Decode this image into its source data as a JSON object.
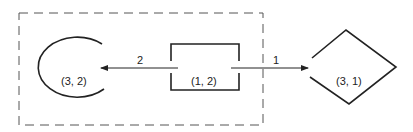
{
  "diagram": {
    "colors": {
      "stroke": "#222222",
      "background": "#ffffff"
    },
    "group": {
      "style": "dashed",
      "contains": [
        "node-3-2",
        "node-1-2"
      ]
    },
    "nodes": [
      {
        "id": "node-3-2",
        "shape": "open-circle",
        "label": "(3, 2)"
      },
      {
        "id": "node-1-2",
        "shape": "open-rectangle",
        "label": "(1, 2)"
      },
      {
        "id": "node-3-1",
        "shape": "open-diamond",
        "label": "(3, 1)"
      }
    ],
    "edges": [
      {
        "from": "node-1-2",
        "to": "node-3-2",
        "label": "2"
      },
      {
        "from": "node-1-2",
        "to": "node-3-1",
        "label": "1"
      }
    ]
  }
}
